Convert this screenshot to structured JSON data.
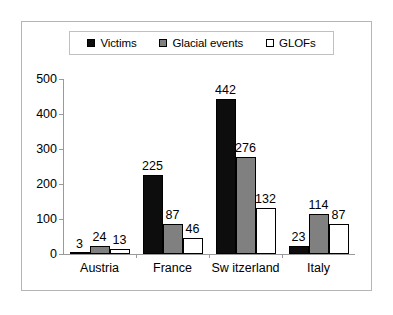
{
  "chart_data": {
    "type": "bar",
    "title": "",
    "subtitle": "",
    "xlabel": "",
    "ylabel": "",
    "ylim": [
      0,
      500
    ],
    "y_ticks": [
      "0",
      "100",
      "200",
      "300",
      "400",
      "500"
    ],
    "grid": false,
    "legend_position": "top",
    "categories": [
      "Austria",
      "France",
      "Sw itzerland",
      "Italy"
    ],
    "series": [
      {
        "name": "Victims",
        "color": "#0d0d0d",
        "values": [
          3,
          225,
          442,
          23
        ],
        "labels": [
          "3",
          "225",
          "442",
          "23"
        ]
      },
      {
        "name": "Glacial events",
        "color": "#808080",
        "values": [
          24,
          87,
          276,
          114
        ],
        "labels": [
          "24",
          "87",
          "276",
          "114"
        ]
      },
      {
        "name": "GLOFs",
        "color": "#ffffff",
        "values": [
          13,
          46,
          132,
          87
        ],
        "labels": [
          "13",
          "46",
          "132",
          "87"
        ]
      }
    ]
  },
  "legend": {
    "entries": [
      {
        "label": "Victims",
        "swatch": "#0d0d0d"
      },
      {
        "label": "Glacial events",
        "swatch": "#808080"
      },
      {
        "label": "GLOFs",
        "swatch": "#ffffff"
      }
    ]
  },
  "axis": {
    "y_ticks": [
      "500",
      "400",
      "300",
      "200",
      "100",
      "0"
    ]
  }
}
